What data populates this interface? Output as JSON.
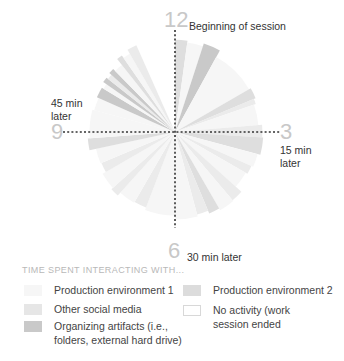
{
  "chart_data": {
    "type": "radial-clock",
    "title": "",
    "legend_title": "TIME SPENT INTERACTING WITH...",
    "center": [
      175,
      132
    ],
    "radius": 95,
    "session_minutes": 60,
    "clock_numerals": [
      {
        "label": "12",
        "position": "top"
      },
      {
        "label": "3",
        "position": "right"
      },
      {
        "label": "6",
        "position": "bottom"
      },
      {
        "label": "9",
        "position": "left"
      }
    ],
    "annotations": [
      {
        "text": "Beginning of session",
        "at": "12"
      },
      {
        "text": "15 min later",
        "at": "3"
      },
      {
        "text": "30 min later",
        "at": "6"
      },
      {
        "text": "45 min later",
        "at": "9"
      }
    ],
    "categories": [
      {
        "key": "prod1",
        "name": "Production environment 1",
        "color": "#f6f6f6"
      },
      {
        "key": "prod2",
        "name": "Production environment 2",
        "color": "#dedede"
      },
      {
        "key": "social",
        "name": "Other social media",
        "color": "#ebebeb"
      },
      {
        "key": "organizing",
        "name": "Organizing artifacts (i.e., folders, external hard drive)",
        "color": "#c9c9c9"
      },
      {
        "key": "none",
        "name": "No activity (work session ended",
        "color": "#ffffff"
      }
    ],
    "segments": [
      {
        "start": 0.0,
        "end": 1.3,
        "category": "prod2",
        "r": 0.97
      },
      {
        "start": 1.3,
        "end": 3.0,
        "category": "prod1",
        "r": 0.95
      },
      {
        "start": 3.0,
        "end": 4.8,
        "category": "organizing",
        "r": 0.98
      },
      {
        "start": 4.8,
        "end": 10.0,
        "category": "prod1",
        "r": 0.9
      },
      {
        "start": 10.0,
        "end": 11.2,
        "category": "prod2",
        "r": 0.92
      },
      {
        "start": 11.2,
        "end": 11.8,
        "category": "social",
        "r": 0.9
      },
      {
        "start": 11.8,
        "end": 14.2,
        "category": "prod1",
        "r": 0.88
      },
      {
        "start": 14.2,
        "end": 15.6,
        "category": "social",
        "r": 0.92
      },
      {
        "start": 15.6,
        "end": 17.5,
        "category": "prod2",
        "r": 0.93
      },
      {
        "start": 17.5,
        "end": 19.0,
        "category": "prod1",
        "r": 0.9
      },
      {
        "start": 19.0,
        "end": 20.0,
        "category": "social",
        "r": 0.88
      },
      {
        "start": 20.0,
        "end": 22.0,
        "category": "prod1",
        "r": 0.86
      },
      {
        "start": 22.0,
        "end": 23.3,
        "category": "social",
        "r": 0.94
      },
      {
        "start": 23.3,
        "end": 25.0,
        "category": "prod1",
        "r": 0.95
      },
      {
        "start": 25.0,
        "end": 26.2,
        "category": "prod2",
        "r": 0.93
      },
      {
        "start": 26.2,
        "end": 27.5,
        "category": "social",
        "r": 0.9
      },
      {
        "start": 27.5,
        "end": 30.0,
        "category": "prod1",
        "r": 0.92
      },
      {
        "start": 30.0,
        "end": 33.5,
        "category": "prod1",
        "r": 0.88
      },
      {
        "start": 33.5,
        "end": 35.0,
        "category": "social",
        "r": 0.85
      },
      {
        "start": 35.0,
        "end": 37.0,
        "category": "prod1",
        "r": 0.86
      },
      {
        "start": 37.0,
        "end": 38.0,
        "category": "social",
        "r": 0.9
      },
      {
        "start": 38.0,
        "end": 40.0,
        "category": "prod1",
        "r": 0.88
      },
      {
        "start": 40.0,
        "end": 41.2,
        "category": "social",
        "r": 0.84
      },
      {
        "start": 41.2,
        "end": 43.0,
        "category": "prod1",
        "r": 0.85
      },
      {
        "start": 43.0,
        "end": 44.3,
        "category": "prod2",
        "r": 0.92
      },
      {
        "start": 44.3,
        "end": 47.5,
        "category": "prod1",
        "r": 0.9
      },
      {
        "start": 47.5,
        "end": 49.0,
        "category": "prod1",
        "r": 0.88
      },
      {
        "start": 49.0,
        "end": 50.2,
        "category": "organizing",
        "r": 0.9
      },
      {
        "start": 50.2,
        "end": 50.8,
        "category": "prod1",
        "r": 0.88
      },
      {
        "start": 50.8,
        "end": 51.4,
        "category": "organizing",
        "r": 0.92
      },
      {
        "start": 51.4,
        "end": 52.0,
        "category": "social",
        "r": 0.9
      },
      {
        "start": 52.0,
        "end": 52.6,
        "category": "organizing",
        "r": 0.93
      },
      {
        "start": 52.6,
        "end": 53.6,
        "category": "prod1",
        "r": 0.9
      },
      {
        "start": 53.6,
        "end": 54.2,
        "category": "prod2",
        "r": 0.98
      },
      {
        "start": 54.2,
        "end": 55.0,
        "category": "prod1",
        "r": 0.95
      },
      {
        "start": 55.0,
        "end": 56.0,
        "category": "social",
        "r": 1.0
      },
      {
        "start": 56.0,
        "end": 60.0,
        "category": "none",
        "r": 1.0
      }
    ]
  },
  "labels": {
    "n12": "12",
    "n3": "3",
    "n6": "6",
    "n9": "9",
    "a12": "Beginning of session",
    "a3_line1": "15 min",
    "a3_line2": "later",
    "a6": "30 min later",
    "a9_line1": "45 min",
    "a9_line2": "later"
  },
  "legend": {
    "title": "TIME SPENT INTERACTING WITH...",
    "items": [
      {
        "label": "Production environment 1",
        "color": "#f6f6f6"
      },
      {
        "label": "Other social media",
        "color": "#e6e6e6"
      },
      {
        "label": "Organizing artifacts (i.e., folders, external hard drive)",
        "color": "#c9c9c9"
      },
      {
        "label": "Production environment 2",
        "color": "#dcdcdc"
      },
      {
        "label": "No activity (work session ended",
        "color": "#ffffff"
      }
    ]
  }
}
